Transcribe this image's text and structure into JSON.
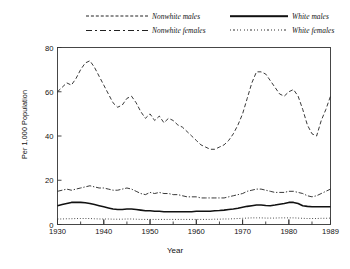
{
  "chart_data": {
    "type": "line",
    "title": "",
    "xlabel": "Year",
    "ylabel": "Per 1,000 Population",
    "xlim": [
      1930,
      1989
    ],
    "ylim": [
      0,
      80
    ],
    "yticks": [
      0,
      20,
      40,
      60,
      80
    ],
    "xticks": [
      1930,
      1940,
      1950,
      1960,
      1970,
      1980,
      1989
    ],
    "xtick_labels": [
      "1930",
      "1940",
      "1950",
      "1960",
      "1970",
      "1980",
      "1989"
    ],
    "ytick_labels": [
      "0",
      "20",
      "40",
      "60",
      "80"
    ],
    "minor_xtick_interval": 5,
    "grid": false,
    "legend_position": "above-plot",
    "x": [
      1930,
      1931,
      1932,
      1933,
      1934,
      1935,
      1936,
      1937,
      1938,
      1939,
      1940,
      1941,
      1942,
      1943,
      1944,
      1945,
      1946,
      1947,
      1948,
      1949,
      1950,
      1951,
      1952,
      1953,
      1954,
      1955,
      1956,
      1957,
      1958,
      1959,
      1960,
      1961,
      1962,
      1963,
      1964,
      1965,
      1966,
      1967,
      1968,
      1969,
      1970,
      1971,
      1972,
      1973,
      1974,
      1975,
      1976,
      1977,
      1978,
      1979,
      1980,
      1981,
      1982,
      1983,
      1984,
      1985,
      1986,
      1987,
      1988,
      1989
    ],
    "series": [
      {
        "name": "Nonwhite males",
        "style": "dashed",
        "color": "#222222",
        "values": [
          60,
          62,
          64,
          63,
          66,
          70,
          73,
          74,
          71,
          67,
          63,
          59,
          55,
          53,
          54,
          57,
          58,
          55,
          51,
          48,
          50,
          47,
          49,
          46,
          48,
          47,
          45,
          44,
          42,
          40,
          38,
          36,
          35,
          34,
          34,
          35,
          36,
          38,
          41,
          45,
          50,
          57,
          64,
          69,
          69,
          68,
          65,
          62,
          59,
          58,
          60,
          61,
          58,
          52,
          45,
          41,
          40,
          47,
          52,
          58
        ]
      },
      {
        "name": "Nonwhite females",
        "style": "dashdot",
        "color": "#222222",
        "values": [
          15,
          15.5,
          16,
          15.5,
          16,
          16.5,
          17,
          17.5,
          17,
          16.5,
          16.5,
          16,
          15.5,
          15.5,
          16,
          16.5,
          16,
          15,
          14,
          13.5,
          14.5,
          14,
          14.5,
          14,
          14,
          13.5,
          13.5,
          13,
          12.5,
          12.5,
          12.5,
          12,
          12,
          12,
          12,
          12,
          12,
          12.5,
          13,
          13.5,
          14,
          15,
          15.5,
          16,
          16,
          15.5,
          15,
          14.5,
          14.5,
          14.5,
          15,
          15,
          14.5,
          14,
          13,
          12.5,
          13,
          14,
          15,
          16
        ]
      },
      {
        "name": "White males",
        "style": "solid",
        "color": "#111111",
        "values": [
          8.5,
          9,
          9.5,
          10,
          10,
          10,
          9.8,
          9.5,
          9,
          8.5,
          8,
          7.5,
          7,
          6.8,
          6.8,
          7,
          7,
          6.8,
          6.5,
          6.2,
          6.2,
          6,
          6,
          5.8,
          5.8,
          5.8,
          5.8,
          5.8,
          5.8,
          5.8,
          6,
          6,
          6,
          6,
          6.2,
          6.3,
          6.5,
          6.8,
          7,
          7.3,
          7.8,
          8.2,
          8.5,
          8.8,
          8.8,
          8.6,
          8.5,
          8.8,
          9.2,
          9.5,
          10,
          10,
          9.5,
          8.5,
          8.2,
          8,
          8,
          8,
          8,
          8
        ]
      },
      {
        "name": "White females",
        "style": "dotted",
        "color": "#333333",
        "values": [
          2.5,
          2.5,
          2.6,
          2.6,
          2.7,
          2.7,
          2.7,
          2.7,
          2.6,
          2.5,
          2.5,
          2.5,
          2.4,
          2.4,
          2.4,
          2.5,
          2.5,
          2.4,
          2.3,
          2.3,
          2.3,
          2.3,
          2.3,
          2.3,
          2.3,
          2.3,
          2.3,
          2.3,
          2.3,
          2.3,
          2.3,
          2.3,
          2.3,
          2.3,
          2.4,
          2.4,
          2.5,
          2.5,
          2.6,
          2.7,
          2.8,
          2.9,
          3,
          3,
          3,
          2.9,
          2.9,
          2.9,
          3,
          3,
          3,
          3,
          2.9,
          2.8,
          2.7,
          2.7,
          2.7,
          2.8,
          2.8,
          2.9
        ]
      }
    ]
  },
  "legend": {
    "entries": [
      {
        "label": "Nonwhite males",
        "style": "dashed"
      },
      {
        "label": "White males",
        "style": "solid"
      },
      {
        "label": "Nonwhite females",
        "style": "dashdot"
      },
      {
        "label": "White females",
        "style": "dotted"
      }
    ]
  },
  "axes": {
    "y_title": "Per 1,000 Population",
    "x_title": "Year"
  }
}
